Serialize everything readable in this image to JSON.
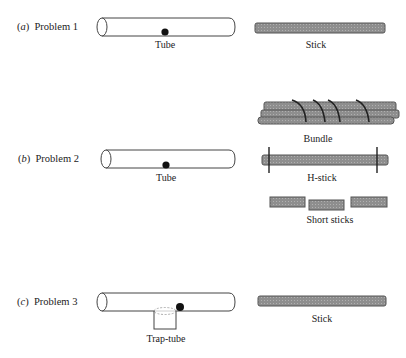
{
  "problems": [
    {
      "letter": "a",
      "label": "Problem 1",
      "left_object": {
        "type": "tube",
        "caption": "Tube"
      },
      "tools": [
        {
          "type": "stick",
          "caption": "Stick"
        }
      ]
    },
    {
      "letter": "b",
      "label": "Problem 2",
      "left_object": {
        "type": "tube",
        "caption": "Tube"
      },
      "tools": [
        {
          "type": "bundle",
          "caption": "Bundle"
        },
        {
          "type": "h-stick",
          "caption": "H-stick"
        },
        {
          "type": "short-sticks",
          "caption": "Short sticks"
        }
      ]
    },
    {
      "letter": "c",
      "label": "Problem 3",
      "left_object": {
        "type": "trap-tube",
        "caption": "Trap-tube"
      },
      "tools": [
        {
          "type": "stick",
          "caption": "Stick"
        }
      ]
    }
  ],
  "colors": {
    "stick_fill": "#8c8c8c",
    "outline": "#333333",
    "reward": "#111111"
  }
}
